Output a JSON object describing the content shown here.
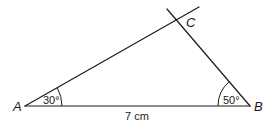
{
  "diagram": {
    "type": "triangle-construction",
    "vertices": {
      "A": {
        "label": "A"
      },
      "B": {
        "label": "B"
      },
      "C": {
        "label": "C"
      }
    },
    "angles": {
      "A": {
        "value_deg": 30,
        "label": "30°"
      },
      "B": {
        "value_deg": 50,
        "label": "50°"
      }
    },
    "sides": {
      "AB": {
        "length": "7 cm",
        "label": "7 cm"
      }
    }
  }
}
